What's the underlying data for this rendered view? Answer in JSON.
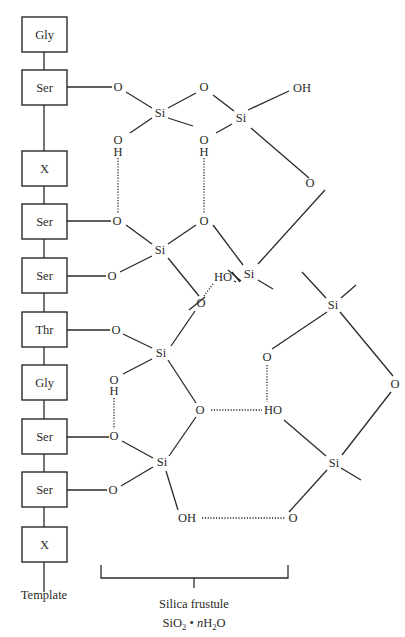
{
  "figure": {
    "caption_partial": "FIGURE 7.",
    "template_label": "Template",
    "frustule_label": "Silica frustule",
    "frustule_formula": {
      "si": "SiO",
      "si_sub": "2",
      "dot": " • ",
      "n": "n",
      "h": "H",
      "h_sub": "2",
      "o": "O"
    }
  },
  "template": {
    "residues": [
      {
        "label": "Gly"
      },
      {
        "label": "Ser"
      },
      {
        "label": "X"
      },
      {
        "label": "Ser"
      },
      {
        "label": "Ser"
      },
      {
        "label": "Thr"
      },
      {
        "label": "Gly"
      },
      {
        "label": "Ser"
      },
      {
        "label": "Ser"
      },
      {
        "label": "X"
      }
    ]
  },
  "atoms": {
    "a1": "O",
    "a2": "Si",
    "a3": "O",
    "a4": "Si",
    "a5": "OH",
    "a6": "O",
    "a7": "H",
    "a8": "O",
    "a9": "H",
    "a10": "O",
    "a11": "O",
    "a12": "Si",
    "a13": "O",
    "a14": "Si",
    "a15": "HO",
    "a16": "O",
    "a17": "O",
    "a18": "O",
    "a19": "Si",
    "a20": "O",
    "a21": "H",
    "a22": "O",
    "a23": "HO",
    "a24": "O",
    "a25": "Si",
    "a26": "O",
    "a27": "OH",
    "a28": "O",
    "a29": "Si",
    "a30": "Si",
    "a31": "O",
    "a32": "O"
  },
  "colors": {
    "ink": "#2a2a2a",
    "background": "#ffffff"
  }
}
